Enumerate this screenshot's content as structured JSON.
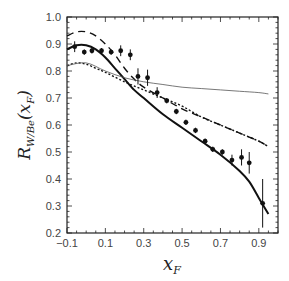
{
  "chart_data": {
    "type": "line",
    "title": "",
    "xlabel": "x_F",
    "ylabel": "R_W/Be(x_F)",
    "xlim": [
      -0.1,
      1.0
    ],
    "ylim": [
      0.2,
      1.0
    ],
    "xticks": [
      "-0.1",
      "0.1",
      "0.3",
      "0.5",
      "0.7",
      "0.9"
    ],
    "yticks": [
      "0.2",
      "0.3",
      "0.4",
      "0.5",
      "0.6",
      "0.7",
      "0.8",
      "0.9",
      "1.0"
    ],
    "grid": false,
    "legend": null,
    "series": [
      {
        "name": "data",
        "style": "points-with-errorbars",
        "x": [
          -0.06,
          -0.01,
          0.03,
          0.08,
          0.13,
          0.18,
          0.23,
          0.27,
          0.32,
          0.37,
          0.42,
          0.47,
          0.52,
          0.57,
          0.62,
          0.66,
          0.71,
          0.76,
          0.81,
          0.85,
          0.92
        ],
        "y": [
          0.89,
          0.87,
          0.875,
          0.875,
          0.87,
          0.875,
          0.86,
          0.78,
          0.775,
          0.72,
          0.69,
          0.65,
          0.61,
          0.58,
          0.54,
          0.51,
          0.5,
          0.47,
          0.48,
          0.46,
          0.31
        ],
        "yerr": [
          0.02,
          0.01,
          0.01,
          0.01,
          0.01,
          0.02,
          0.02,
          0.03,
          0.03,
          0.02,
          0.01,
          0.01,
          0.01,
          0.01,
          0.01,
          0.01,
          0.01,
          0.02,
          0.03,
          0.04,
          0.09
        ]
      },
      {
        "name": "solid-thick",
        "style": "solid",
        "x": [
          -0.1,
          -0.05,
          0.0,
          0.05,
          0.1,
          0.15,
          0.2,
          0.25,
          0.3,
          0.4,
          0.5,
          0.6,
          0.7,
          0.8,
          0.85,
          0.9,
          0.95
        ],
        "y": [
          0.88,
          0.895,
          0.895,
          0.88,
          0.85,
          0.81,
          0.77,
          0.73,
          0.7,
          0.64,
          0.59,
          0.54,
          0.49,
          0.43,
          0.39,
          0.33,
          0.27
        ]
      },
      {
        "name": "dashed",
        "style": "dashed",
        "x": [
          -0.1,
          -0.05,
          0.0,
          0.05,
          0.1,
          0.15,
          0.2,
          0.25,
          0.3,
          0.4,
          0.5,
          0.6,
          0.7,
          0.8,
          0.9,
          0.95
        ],
        "y": [
          0.93,
          0.945,
          0.945,
          0.93,
          0.9,
          0.86,
          0.81,
          0.77,
          0.74,
          0.7,
          0.66,
          0.63,
          0.6,
          0.57,
          0.54,
          0.52
        ]
      },
      {
        "name": "dotted",
        "style": "dotted",
        "x": [
          -0.1,
          -0.05,
          0.0,
          0.05,
          0.1,
          0.2,
          0.3,
          0.4,
          0.5,
          0.6,
          0.7,
          0.8,
          0.9,
          0.95
        ],
        "y": [
          0.82,
          0.83,
          0.825,
          0.81,
          0.795,
          0.76,
          0.73,
          0.7,
          0.67,
          0.63,
          0.6,
          0.57,
          0.54,
          0.52
        ]
      },
      {
        "name": "thin-solid",
        "style": "solid-thin",
        "x": [
          -0.1,
          0.0,
          0.1,
          0.2,
          0.3,
          0.4,
          0.5,
          0.6,
          0.7,
          0.8,
          0.9,
          0.95
        ],
        "y": [
          0.82,
          0.83,
          0.8,
          0.775,
          0.76,
          0.75,
          0.74,
          0.735,
          0.73,
          0.725,
          0.72,
          0.715
        ]
      }
    ]
  }
}
